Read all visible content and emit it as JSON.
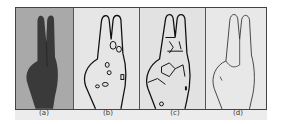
{
  "figure": {
    "panels": [
      {
        "id": "a",
        "label": "(a)",
        "description": "original grayscale hand image"
      },
      {
        "id": "b",
        "label": "(b)",
        "description": "hand contour with segmented regions"
      },
      {
        "id": "c",
        "label": "(c)",
        "description": "over-segmented hand contour"
      },
      {
        "id": "d",
        "label": "(d)",
        "description": "refined thin hand outline"
      }
    ]
  }
}
